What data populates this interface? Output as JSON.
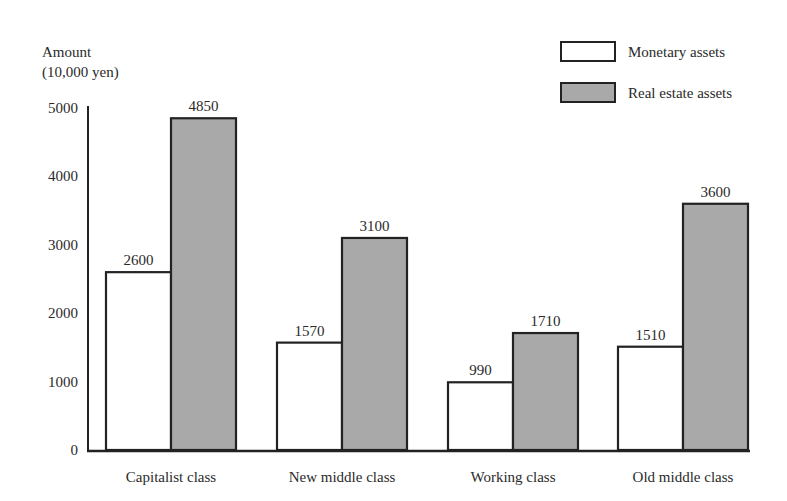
{
  "chart_data": {
    "type": "bar",
    "title": "",
    "ylabel_line1": "Amount",
    "ylabel_line2": "(10,000 yen)",
    "xlabel": "",
    "ylim": [
      0,
      5000
    ],
    "yticks": [
      0,
      1000,
      2000,
      3000,
      4000,
      5000
    ],
    "grid": false,
    "legend_position": "top-right",
    "categories": [
      "Capitalist class",
      "New middle class",
      "Working class",
      "Old middle class"
    ],
    "series": [
      {
        "name": "Monetary assets",
        "values": [
          2600,
          1570,
          990,
          1510
        ],
        "color": "#ffffff"
      },
      {
        "name": "Real estate assets",
        "values": [
          4850,
          3100,
          1710,
          3600
        ],
        "color": "#a9a9a9"
      }
    ]
  },
  "colors": {
    "stroke": "#222222",
    "text": "#2a2a2a",
    "background": "#ffffff"
  }
}
